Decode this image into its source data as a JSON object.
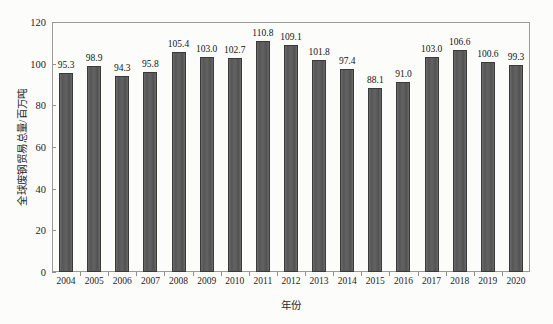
{
  "chart_data": {
    "type": "bar",
    "title": "",
    "xlabel": "年份",
    "ylabel": "全球废钢贸易总量/百万吨",
    "categories": [
      "2004",
      "2005",
      "2006",
      "2007",
      "2008",
      "2009",
      "2010",
      "2011",
      "2012",
      "2013",
      "2014",
      "2015",
      "2016",
      "2017",
      "2018",
      "2019",
      "2020"
    ],
    "values": [
      95.3,
      98.9,
      94.3,
      95.8,
      105.4,
      103.0,
      102.7,
      110.8,
      109.1,
      101.8,
      97.4,
      88.1,
      91.0,
      103.0,
      106.6,
      100.6,
      99.3
    ],
    "value_labels": [
      "95.3",
      "98.9",
      "94.3",
      "95.8",
      "105.4",
      "103.0",
      "102.7",
      "110.8",
      "109.1",
      "101.8",
      "97.4",
      "88.1",
      "91.0",
      "103.0",
      "106.6",
      "100.6",
      "99.3"
    ],
    "ylim": [
      0,
      120
    ],
    "yticks": [
      0,
      20,
      40,
      60,
      80,
      100,
      120
    ],
    "ytick_labels": [
      "0",
      "20",
      "40",
      "60",
      "80",
      "100",
      "120"
    ],
    "grid": false,
    "legend": false,
    "legend_position": "none",
    "bar_color": "#5e5e5e",
    "bar_edge_color": "#3a3a3a",
    "frame_color": "#9a9a98",
    "background_color": "#fcfcfb",
    "text_color": "#1d1d1d"
  }
}
